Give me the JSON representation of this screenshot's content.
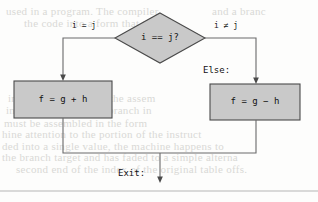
{
  "diagram": {
    "type": "flowchart",
    "decision": {
      "id": "decision-node",
      "shape": "diamond",
      "text": "i == j?",
      "cx": 160,
      "cy": 38,
      "rx": 45,
      "ry": 25
    },
    "branches": [
      {
        "id": "true-branch",
        "label": "i = j",
        "label_x": 72,
        "label_y": 21
      },
      {
        "id": "false-branch",
        "label": "i ≠ j",
        "label_x": 214,
        "label_y": 21
      }
    ],
    "annotations": [
      {
        "id": "else-annotation",
        "text": "Else:",
        "x": 203,
        "y": 65
      },
      {
        "id": "exit-annotation",
        "text": "Exit:",
        "x": 118,
        "y": 168
      }
    ],
    "process_boxes": [
      {
        "id": "then-box",
        "text": "f = g + h",
        "x": 14,
        "y": 81,
        "w": 98,
        "h": 37
      },
      {
        "id": "else-box",
        "text": "f = g − h",
        "x": 210,
        "y": 84,
        "w": 90,
        "h": 36
      }
    ],
    "colors": {
      "node_fill": "#c9c9c9",
      "node_stroke": "#4a4a4a",
      "connector": "#6a6a6a",
      "text": "#111111",
      "rule": "#b5b5b5",
      "bleed_text": "#d9d9d6"
    },
    "merge_y": 153,
    "exit_x": 160,
    "exit_arrow_y": 182,
    "bottom_rule_y": 191
  },
  "background_text": {
    "note": "faint show-through text from the reverse side of the printed page",
    "lines": [
      {
        "text": "used in  a  program.  The  compiler",
        "x": 6,
        "y": 5
      },
      {
        "text": "and a  branc",
        "x": 212,
        "y": 5
      },
      {
        "text": "the  code  into  a  form  that  the",
        "x": 24,
        "y": 17
      },
      {
        "text": "in  the  program.  Then  the  assem",
        "x": 8,
        "y": 92
      },
      {
        "text": "into  machine  code.  A  branch  in",
        "x": 6,
        "y": 104
      },
      {
        "text": "must  be  assembled  in  the  form",
        "x": 4,
        "y": 117
      },
      {
        "text": "hine  attention  to  the  portion  of  the  instruct",
        "x": 2,
        "y": 128
      },
      {
        "text": "ded  into  a  single  value,  the  machine  happens  to",
        "x": 2,
        "y": 140
      },
      {
        "text": "the  branch  target  and  has  faded  to  a  simple  alterna",
        "x": 2,
        "y": 151
      },
      {
        "text": "second  end  of  the  index  of  the  original  table  offs.",
        "x": 16,
        "y": 163
      }
    ]
  }
}
